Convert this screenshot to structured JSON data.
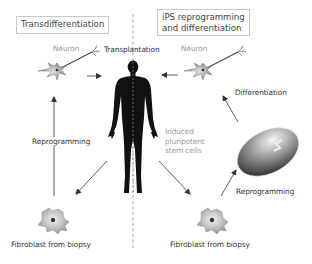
{
  "diagram": {
    "left_panel": {
      "title": "Transdifferentiation",
      "neuron_label": "Neuron",
      "reprogramming_label": "Reprogramming",
      "fibroblast_label": "Fibroblast from biopsy"
    },
    "right_panel": {
      "title_line1": "iPS reprogramming",
      "title_line2": "and differentiation",
      "neuron_label": "Neuron",
      "differentiation_label": "Differentiation",
      "ipsc_line1": "Induced",
      "ipsc_line2": "pluripotent",
      "ipsc_line3": "stem cells",
      "reprogramming_label": "Reprogramming",
      "fibroblast_label": "Fibroblast from biopsy"
    },
    "center": {
      "transplantation_label": "Transplantation",
      "figure": "human-body-silhouette"
    },
    "colors": {
      "figure": "#111111",
      "box_border": "#c8c8c8",
      "text": "#333333",
      "muted_text": "#9a9a9a",
      "arrow": "#333333",
      "cell_fill": "#bdbdbd"
    }
  }
}
